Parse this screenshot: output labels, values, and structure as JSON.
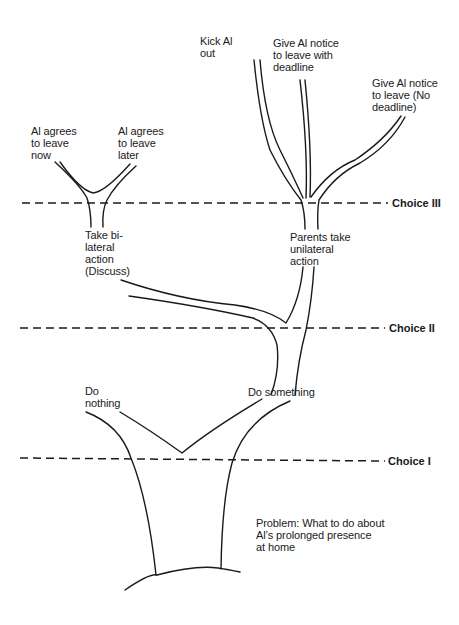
{
  "diagram": {
    "type": "decision-tree",
    "choice_levels": [
      {
        "id": "choice-3",
        "label": "Choice III"
      },
      {
        "id": "choice-2",
        "label": "Choice II"
      },
      {
        "id": "choice-1",
        "label": "Choice I"
      }
    ],
    "nodes": {
      "problem": "Problem: What to do about\nAl’s prolonged presence\nat home",
      "do_nothing": "Do\nnothing",
      "do_something": "Do something",
      "bilateral": "Take bi-\nlateral\naction\n(Discuss)",
      "unilateral": "Parents take\nunilateral\naction",
      "agree_now": "Al agrees\nto leave\nnow",
      "agree_later": "Al agrees\nto leave\nlater",
      "kick_out": "Kick Al\nout",
      "notice_deadline": "Give Al notice\nto leave with\ndeadline",
      "notice_no_deadline": "Give Al notice\nto leave (No\ndeadline)"
    },
    "edges": [
      {
        "from": "problem",
        "to": "do_nothing",
        "level": "Choice I"
      },
      {
        "from": "problem",
        "to": "do_something",
        "level": "Choice I"
      },
      {
        "from": "do_something",
        "to": "bilateral",
        "level": "Choice II"
      },
      {
        "from": "do_something",
        "to": "unilateral",
        "level": "Choice II"
      },
      {
        "from": "bilateral",
        "to": "agree_now",
        "level": "Choice III"
      },
      {
        "from": "bilateral",
        "to": "agree_later",
        "level": "Choice III"
      },
      {
        "from": "unilateral",
        "to": "kick_out",
        "level": "Choice III"
      },
      {
        "from": "unilateral",
        "to": "notice_deadline",
        "level": "Choice III"
      },
      {
        "from": "unilateral",
        "to": "notice_no_deadline",
        "level": "Choice III"
      }
    ]
  }
}
